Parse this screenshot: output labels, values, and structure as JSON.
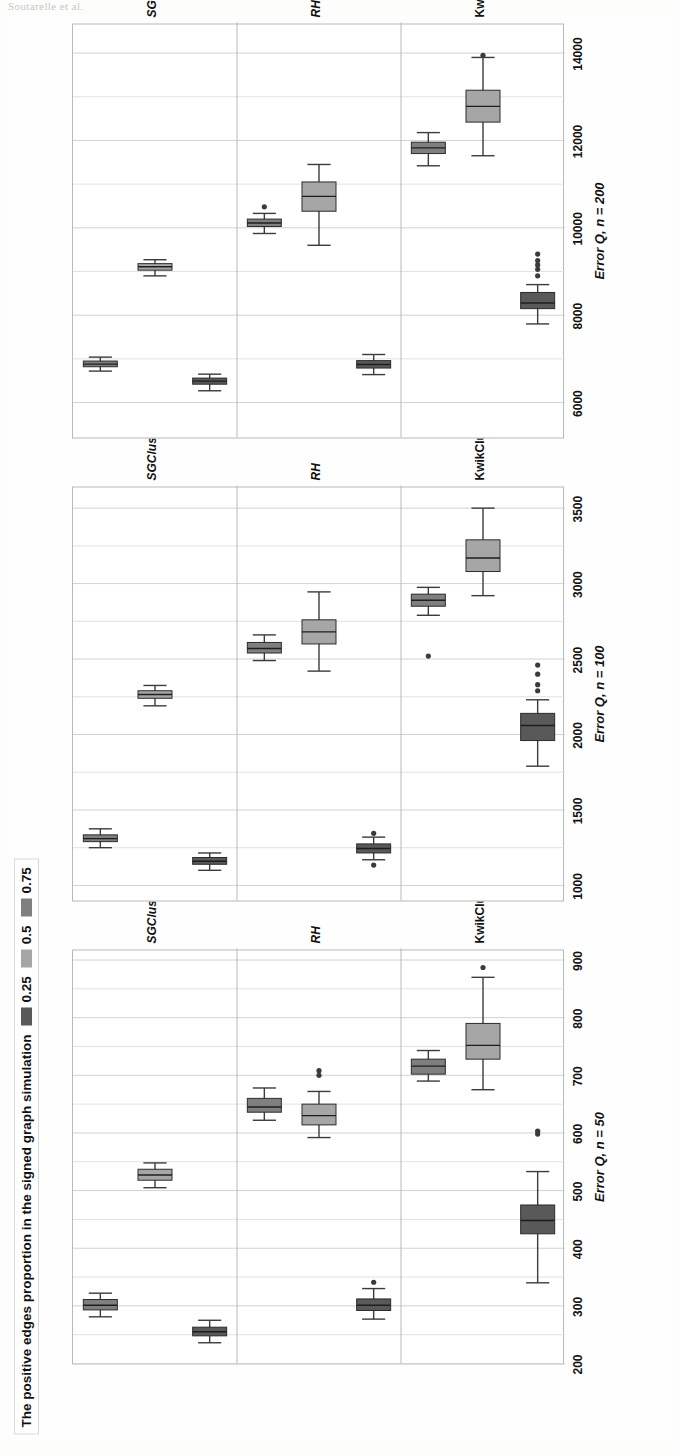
{
  "page_header_remnant": "Soutarelle et al.",
  "legend": {
    "title": "The positive edges proportion in the  signed graph simulation",
    "items": [
      {
        "label": "0.25",
        "color": "#595959"
      },
      {
        "label": "0.5",
        "color": "#a6a6a6"
      },
      {
        "label": "0.75",
        "color": "#7f7f7f"
      }
    ]
  },
  "categories": [
    "KwikCluster",
    "RH",
    "SGClust"
  ],
  "category_sub": [
    "",
    "",
    "α"
  ],
  "chart_data": {
    "type": "box",
    "orientation": "horizontal-facets",
    "grid": true,
    "legend_position": "top-left",
    "legend_title": "The positive edges proportion in the  signed graph simulation",
    "series_names": [
      "0.25",
      "0.5",
      "0.75"
    ],
    "series_colors": [
      "#595959",
      "#a6a6a6",
      "#7f7f7f"
    ],
    "facet_categories": [
      "KwikCluster",
      "RH",
      "SGClustα"
    ],
    "panels": [
      {
        "name": "n50",
        "ylabel": "Error Q, n = 50",
        "xlabel": "",
        "ylim": [
          200,
          920
        ],
        "yticks": [
          900,
          800,
          700,
          600,
          500,
          400,
          300,
          200
        ],
        "boxes": [
          {
            "facet": "KwikCluster",
            "series": "0.25",
            "lower_whisker": 340,
            "q1": 425,
            "median": 448,
            "q3": 475,
            "upper_whisker": 533,
            "outliers": [
              598,
              603
            ]
          },
          {
            "facet": "KwikCluster",
            "series": "0.5",
            "lower_whisker": 675,
            "q1": 728,
            "median": 752,
            "q3": 790,
            "upper_whisker": 870,
            "outliers": [
              887
            ]
          },
          {
            "facet": "KwikCluster",
            "series": "0.75",
            "lower_whisker": 690,
            "q1": 702,
            "median": 716,
            "q3": 728,
            "upper_whisker": 743,
            "outliers": []
          },
          {
            "facet": "RH",
            "series": "0.25",
            "lower_whisker": 277,
            "q1": 292,
            "median": 301,
            "q3": 312,
            "upper_whisker": 330,
            "outliers": [
              341
            ]
          },
          {
            "facet": "RH",
            "series": "0.5",
            "lower_whisker": 592,
            "q1": 614,
            "median": 630,
            "q3": 650,
            "upper_whisker": 672,
            "outliers": [
              700,
              708
            ]
          },
          {
            "facet": "RH",
            "series": "0.75",
            "lower_whisker": 622,
            "q1": 636,
            "median": 645,
            "q3": 660,
            "upper_whisker": 678,
            "outliers": []
          },
          {
            "facet": "SGClustα",
            "series": "0.25",
            "lower_whisker": 236,
            "q1": 248,
            "median": 255,
            "q3": 263,
            "upper_whisker": 275,
            "outliers": []
          },
          {
            "facet": "SGClustα",
            "series": "0.5",
            "lower_whisker": 505,
            "q1": 518,
            "median": 527,
            "q3": 537,
            "upper_whisker": 548,
            "outliers": []
          },
          {
            "facet": "SGClustα",
            "series": "0.75",
            "lower_whisker": 281,
            "q1": 293,
            "median": 301,
            "q3": 311,
            "upper_whisker": 322,
            "outliers": []
          }
        ]
      },
      {
        "name": "n100",
        "ylabel": "Error Q, n = 100",
        "xlabel": "",
        "ylim": [
          900,
          3650
        ],
        "yticks": [
          3500,
          3000,
          2500,
          2000,
          1500,
          1000
        ],
        "boxes": [
          {
            "facet": "KwikCluster",
            "series": "0.25",
            "lower_whisker": 1790,
            "q1": 1960,
            "median": 2060,
            "q3": 2140,
            "upper_whisker": 2230,
            "outliers": [
              2290,
              2330,
              2400,
              2460
            ]
          },
          {
            "facet": "KwikCluster",
            "series": "0.5",
            "lower_whisker": 2920,
            "q1": 3080,
            "median": 3170,
            "q3": 3290,
            "upper_whisker": 3500,
            "outliers": []
          },
          {
            "facet": "KwikCluster",
            "series": "0.75",
            "lower_whisker": 2790,
            "q1": 2850,
            "median": 2890,
            "q3": 2930,
            "upper_whisker": 2975,
            "outliers": [
              2520
            ]
          },
          {
            "facet": "RH",
            "series": "0.25",
            "lower_whisker": 1170,
            "q1": 1215,
            "median": 1245,
            "q3": 1275,
            "upper_whisker": 1320,
            "outliers": [
              1135,
              1345
            ]
          },
          {
            "facet": "RH",
            "series": "0.5",
            "lower_whisker": 2420,
            "q1": 2600,
            "median": 2680,
            "q3": 2760,
            "upper_whisker": 2945,
            "outliers": []
          },
          {
            "facet": "RH",
            "series": "0.75",
            "lower_whisker": 2490,
            "q1": 2540,
            "median": 2570,
            "q3": 2610,
            "upper_whisker": 2660,
            "outliers": []
          },
          {
            "facet": "SGClustα",
            "series": "0.25",
            "lower_whisker": 1100,
            "q1": 1140,
            "median": 1160,
            "q3": 1185,
            "upper_whisker": 1215,
            "outliers": []
          },
          {
            "facet": "SGClustα",
            "series": "0.5",
            "lower_whisker": 2190,
            "q1": 2240,
            "median": 2265,
            "q3": 2290,
            "upper_whisker": 2325,
            "outliers": []
          },
          {
            "facet": "SGClustα",
            "series": "0.75",
            "lower_whisker": 1250,
            "q1": 1290,
            "median": 1310,
            "q3": 1335,
            "upper_whisker": 1375,
            "outliers": []
          }
        ]
      },
      {
        "name": "n200",
        "ylabel": "Error Q, n = 200",
        "xlabel": "",
        "ylim": [
          5200,
          14700
        ],
        "yticks": [
          14000,
          12000,
          10000,
          8000,
          6000
        ],
        "boxes": [
          {
            "facet": "KwikCluster",
            "series": "0.25",
            "lower_whisker": 7800,
            "q1": 8150,
            "median": 8280,
            "q3": 8520,
            "upper_whisker": 8700,
            "outliers": [
              8900,
              9050,
              9150,
              9250,
              9400
            ]
          },
          {
            "facet": "KwikCluster",
            "series": "0.5",
            "lower_whisker": 11650,
            "q1": 12420,
            "median": 12780,
            "q3": 13150,
            "upper_whisker": 13900,
            "outliers": [
              13950
            ]
          },
          {
            "facet": "KwikCluster",
            "series": "0.75",
            "lower_whisker": 11420,
            "q1": 11700,
            "median": 11830,
            "q3": 11960,
            "upper_whisker": 12180,
            "outliers": []
          },
          {
            "facet": "RH",
            "series": "0.25",
            "lower_whisker": 6640,
            "q1": 6790,
            "median": 6870,
            "q3": 6960,
            "upper_whisker": 7100,
            "outliers": []
          },
          {
            "facet": "RH",
            "series": "0.5",
            "lower_whisker": 9600,
            "q1": 10380,
            "median": 10720,
            "q3": 11050,
            "upper_whisker": 11450,
            "outliers": []
          },
          {
            "facet": "RH",
            "series": "0.75",
            "lower_whisker": 9870,
            "q1": 10030,
            "median": 10110,
            "q3": 10200,
            "upper_whisker": 10330,
            "outliers": [
              10480
            ]
          },
          {
            "facet": "SGClustα",
            "series": "0.25",
            "lower_whisker": 6270,
            "q1": 6420,
            "median": 6490,
            "q3": 6560,
            "upper_whisker": 6650,
            "outliers": []
          },
          {
            "facet": "SGClustα",
            "series": "0.5",
            "lower_whisker": 8900,
            "q1": 9030,
            "median": 9110,
            "q3": 9180,
            "upper_whisker": 9270,
            "outliers": []
          },
          {
            "facet": "SGClustα",
            "series": "0.75",
            "lower_whisker": 6720,
            "q1": 6820,
            "median": 6880,
            "q3": 6950,
            "upper_whisker": 7040,
            "outliers": []
          }
        ]
      }
    ]
  }
}
